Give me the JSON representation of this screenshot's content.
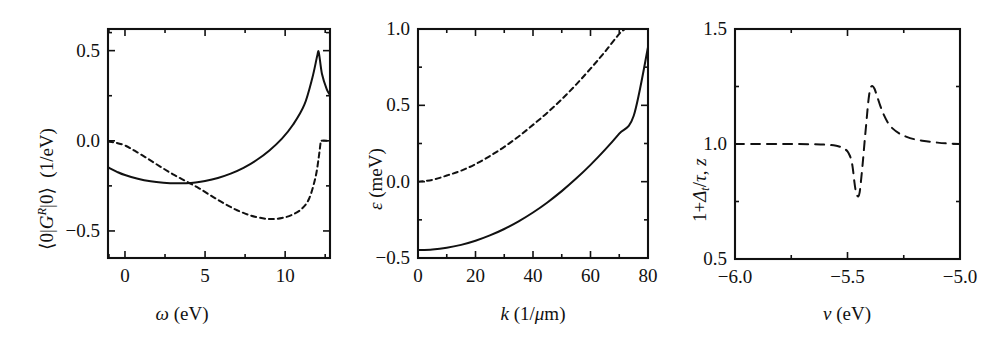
{
  "figure": {
    "background": "#ffffff",
    "ink": "#111111",
    "panel_count": 3
  },
  "chart_data": [
    {
      "id": "panel-a",
      "type": "line",
      "title": "",
      "xlabel": "ω (eV)",
      "xlabel_parts": {
        "symbol": "ω",
        "unit": "(eV)"
      },
      "ylabel": "⟨0|Gᴿ|0⟩  (1/eV)",
      "ylabel_parts": {
        "bra": "⟨0|",
        "operator": "G",
        "superscript": "R",
        "ket": "|0⟩",
        "unit": "(1/eV)"
      },
      "xlim": [
        -1.06,
        12.8
      ],
      "ylim": [
        -0.65,
        0.62
      ],
      "xticks": [
        0,
        5,
        10
      ],
      "xticklabels": [
        "0",
        "5",
        "10"
      ],
      "xminorticks": [
        -1,
        2.5,
        7.5,
        12.5
      ],
      "yticks": [
        -0.5,
        0.0,
        0.5
      ],
      "yticklabels": [
        "-0.5",
        "0.0",
        "0.5"
      ],
      "yminorticks": [
        -0.25,
        0.25,
        0.6
      ],
      "grid": false,
      "legend": "none",
      "series": [
        {
          "name": "real-part-solid",
          "style": "solid",
          "color": "#111111",
          "x": [
            -1.05,
            -0.5,
            0.0,
            0.8,
            1.6,
            2.4,
            3.2,
            3.8,
            4.4,
            5.0,
            5.8,
            6.6,
            7.4,
            8.2,
            9.0,
            9.8,
            10.5,
            11.2,
            11.7,
            12.0,
            12.1,
            12.3,
            12.6,
            12.8
          ],
          "y": [
            -0.148,
            -0.172,
            -0.19,
            -0.21,
            -0.224,
            -0.232,
            -0.236,
            -0.235,
            -0.231,
            -0.223,
            -0.206,
            -0.182,
            -0.15,
            -0.108,
            -0.055,
            0.012,
            0.09,
            0.2,
            0.35,
            0.47,
            0.49,
            0.37,
            0.285,
            0.255
          ]
        },
        {
          "name": "imaginary-part-dashed",
          "style": "dashed",
          "color": "#111111",
          "x": [
            -1.05,
            -0.6,
            0.0,
            0.6,
            1.4,
            2.2,
            3.0,
            3.8,
            4.6,
            5.4,
            6.2,
            7.0,
            7.8,
            8.6,
            9.2,
            9.8,
            10.4,
            11.0,
            11.5,
            11.9,
            12.1,
            12.2,
            12.25,
            12.8
          ],
          "y": [
            -0.005,
            -0.01,
            -0.026,
            -0.055,
            -0.098,
            -0.143,
            -0.186,
            -0.224,
            -0.262,
            -0.306,
            -0.348,
            -0.385,
            -0.413,
            -0.43,
            -0.434,
            -0.428,
            -0.412,
            -0.38,
            -0.32,
            -0.2,
            -0.09,
            -0.02,
            0.0,
            0.0
          ]
        }
      ]
    },
    {
      "id": "panel-b",
      "type": "line",
      "title": "",
      "xlabel": "k (1/μm)",
      "xlabel_parts": {
        "symbol": "k",
        "unit": "(1/μm)"
      },
      "ylabel": "ε (meV)",
      "ylabel_parts": {
        "symbol": "ε",
        "unit": "(meV)"
      },
      "xlim": [
        0,
        80
      ],
      "ylim": [
        -0.5,
        1.0
      ],
      "xticks": [
        0,
        20,
        40,
        60,
        80
      ],
      "xticklabels": [
        "0",
        "20",
        "40",
        "60",
        "80"
      ],
      "xminorticks": [
        10,
        30,
        50,
        70
      ],
      "yticks": [
        -0.5,
        0.0,
        0.5,
        1.0
      ],
      "yticklabels": [
        "-0.5",
        "0.0",
        "0.5",
        "1.0"
      ],
      "yminorticks": [
        -0.25,
        0.25,
        0.75
      ],
      "grid": false,
      "legend": "none",
      "series": [
        {
          "name": "lower-band-solid",
          "style": "solid",
          "color": "#111111",
          "x": [
            0,
            5,
            10,
            15,
            20,
            25,
            30,
            35,
            40,
            45,
            50,
            55,
            60,
            65,
            70,
            75,
            80
          ],
          "y": [
            -0.448,
            -0.444,
            -0.433,
            -0.414,
            -0.387,
            -0.352,
            -0.31,
            -0.26,
            -0.202,
            -0.136,
            -0.062,
            0.02,
            0.11,
            0.208,
            0.315,
            0.43,
            0.88
          ]
        },
        {
          "name": "upper-band-dashed",
          "style": "dashed",
          "color": "#111111",
          "x": [
            0,
            5,
            10,
            15,
            20,
            25,
            30,
            35,
            40,
            45,
            50,
            55,
            60,
            65,
            70,
            72
          ],
          "y": [
            0.0,
            0.012,
            0.04,
            0.072,
            0.115,
            0.168,
            0.228,
            0.296,
            0.372,
            0.452,
            0.54,
            0.636,
            0.74,
            0.85,
            0.968,
            1.0
          ]
        }
      ]
    },
    {
      "id": "panel-c",
      "type": "line",
      "title": "",
      "xlabel": "v (eV)",
      "xlabel_parts": {
        "symbol": "v",
        "unit": "(eV)"
      },
      "ylabel": "1+Δₜ/τ, z",
      "ylabel_parts": {
        "lead": "1+",
        "delta": "Δ",
        "subscript": "t",
        "over": "/τ,",
        "zed": "z"
      },
      "xlim": [
        -6.0,
        -5.0
      ],
      "ylim": [
        0.5,
        1.5
      ],
      "xticks": [
        -6.0,
        -5.5,
        -5.0
      ],
      "xticklabels": [
        "-6.0",
        "-5.5",
        "-5.0"
      ],
      "xminorticks": [
        -5.75,
        -5.25
      ],
      "yticks": [
        0.5,
        1.0,
        1.5
      ],
      "yticklabels": [
        "0.5",
        "1.0",
        "1.5"
      ],
      "yminorticks": [
        0.75,
        1.25
      ],
      "grid": false,
      "legend": "none",
      "series": [
        {
          "name": "resonance-dashed",
          "style": "dashed",
          "color": "#111111",
          "x": [
            -6.0,
            -5.9,
            -5.8,
            -5.72,
            -5.66,
            -5.62,
            -5.58,
            -5.55,
            -5.53,
            -5.515,
            -5.5,
            -5.49,
            -5.483,
            -5.478,
            -5.474,
            -5.47,
            -5.465,
            -5.46,
            -5.452,
            -5.446,
            -5.44,
            -5.432,
            -5.424,
            -5.416,
            -5.41,
            -5.404,
            -5.398,
            -5.39,
            -5.38,
            -5.37,
            -5.355,
            -5.34,
            -5.32,
            -5.3,
            -5.27,
            -5.24,
            -5.2,
            -5.15,
            -5.1,
            -5.05,
            -5.0
          ],
          "y": [
            1.0,
            1.0,
            1.0,
            1.0,
            0.999,
            0.998,
            0.996,
            0.992,
            0.987,
            0.98,
            0.968,
            0.95,
            0.93,
            0.905,
            0.875,
            0.84,
            0.805,
            0.782,
            0.772,
            0.79,
            0.84,
            0.92,
            1.01,
            1.095,
            1.16,
            1.212,
            1.243,
            1.252,
            1.24,
            1.212,
            1.168,
            1.13,
            1.092,
            1.068,
            1.046,
            1.032,
            1.02,
            1.012,
            1.006,
            1.002,
            1.0
          ]
        }
      ]
    }
  ]
}
